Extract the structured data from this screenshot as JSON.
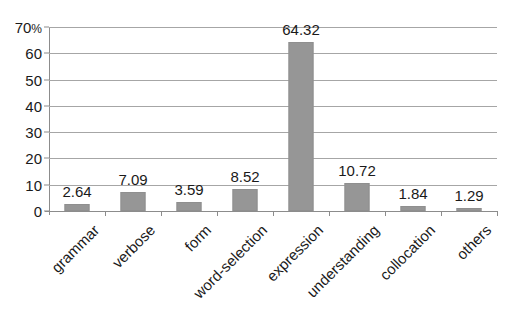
{
  "chart_data": {
    "type": "bar",
    "title": "",
    "subtitle": "",
    "xlabel": "",
    "ylabel": "",
    "unit_label": "%",
    "ylim": [
      0,
      70
    ],
    "ytick_values": [
      0,
      10,
      20,
      30,
      40,
      50,
      60,
      70
    ],
    "ytick_labels": [
      "0",
      "10",
      "20",
      "30",
      "40",
      "50",
      "60",
      "70"
    ],
    "top_tick_suffix": "%",
    "grid": true,
    "grid_axis": "y",
    "legend": false,
    "legend_position": "none",
    "bar_color": "#969696",
    "categories": [
      "grammar",
      "verbose",
      "form",
      "word-selection",
      "expression",
      "understanding",
      "collocation",
      "others"
    ],
    "values": [
      2.64,
      7.09,
      3.59,
      8.52,
      64.32,
      10.72,
      1.84,
      1.29
    ],
    "data_labels": [
      "2.64",
      "7.09",
      "3.59",
      "8.52",
      "64.32",
      "10.72",
      "1.84",
      "1.29"
    ]
  }
}
